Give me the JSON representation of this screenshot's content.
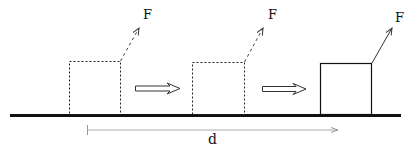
{
  "diagram": {
    "labels": {
      "force": [
        "F",
        "F",
        "F"
      ],
      "displacement": "d"
    },
    "elements": {
      "ground": "horizontal surface",
      "blocks": [
        {
          "position": "initial",
          "style": "dashed"
        },
        {
          "position": "intermediate",
          "style": "dashed"
        },
        {
          "position": "final",
          "style": "solid"
        }
      ],
      "motion_arrows": 2,
      "force_arrows": [
        {
          "style": "dashed",
          "direction": "up-right"
        },
        {
          "style": "dashed",
          "direction": "up-right"
        },
        {
          "style": "solid",
          "direction": "up-right"
        }
      ],
      "displacement_arrow": {
        "label": "d",
        "direction": "right"
      }
    },
    "colors": {
      "ink": "#111111",
      "displacement_line": "#9a9a9a",
      "background": "#ffffff"
    }
  }
}
